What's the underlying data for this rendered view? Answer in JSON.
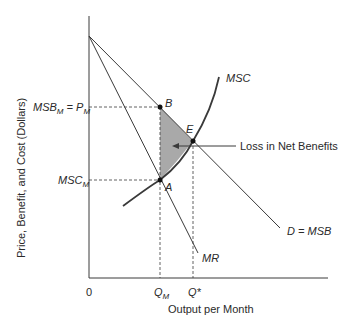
{
  "diagram": {
    "type": "monopoly-deadweight-loss",
    "axes": {
      "y_label": "Price, Benefit, and Cost (Dollars)",
      "x_label": "Output per Month",
      "origin_label": "0"
    },
    "curves": {
      "demand": "D = MSB",
      "marginal_revenue": "MR",
      "marginal_social_cost": "MSC"
    },
    "points": {
      "B": "B",
      "A": "A",
      "E": "E"
    },
    "y_ticks": {
      "msb_m": {
        "main": "MSB",
        "sub": "M",
        "eq": " = P",
        "sub2": "M"
      },
      "msc_m": {
        "main": "MSC",
        "sub": "M"
      }
    },
    "x_ticks": {
      "q_m": {
        "main": "Q",
        "sub": "M"
      },
      "q_star": "Q*"
    },
    "annotation": "Loss in Net Benefits",
    "colors": {
      "line": "#3a3a3a",
      "shade": "#a9a9a9",
      "text": "#2a2a2a"
    }
  }
}
